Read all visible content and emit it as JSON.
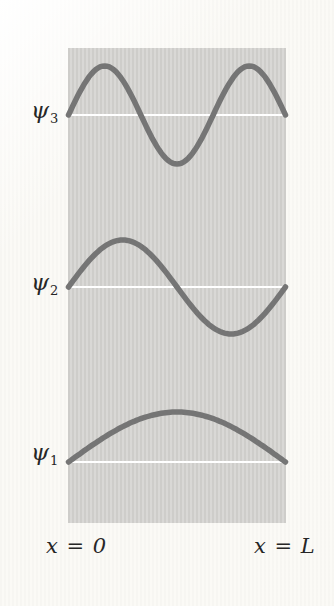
{
  "figure": {
    "colors": {
      "page_background": "#fbfaf6",
      "box_fill": "#d7d6d3",
      "curve": "#757575",
      "baseline": "#ffffff",
      "text": "#262626"
    },
    "chart_data": {
      "type": "line",
      "description_visible_content": "Three standing-wave curves drawn inside a shaded box, each above a white horizontal baseline",
      "x_axis": {
        "left_label": "x = 0",
        "right_label": "x = L"
      },
      "series": [
        {
          "name": "psi-3",
          "symbol": "ψ",
          "subscript": "3",
          "quantum_number": 3,
          "antinodes": 3,
          "interior_nodes": 2
        },
        {
          "name": "psi-2",
          "symbol": "ψ",
          "subscript": "2",
          "quantum_number": 2,
          "antinodes": 2,
          "interior_nodes": 1
        },
        {
          "name": "psi-1",
          "symbol": "ψ",
          "subscript": "1",
          "quantum_number": 1,
          "antinodes": 1,
          "interior_nodes": 0
        }
      ]
    }
  }
}
